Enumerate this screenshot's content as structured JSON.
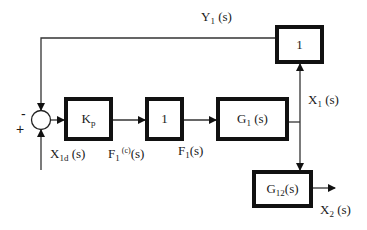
{
  "diagram": {
    "type": "block-diagram",
    "blocks": {
      "kp": {
        "main": "K",
        "sub": "p"
      },
      "unity_mid": {
        "label": "1"
      },
      "g1": {
        "main": "G",
        "sub": "1",
        "tail": " (s)"
      },
      "unity_feedback": {
        "label": "1"
      },
      "g12": {
        "main": "G",
        "sub": "12",
        "tail": "(s)"
      }
    },
    "summing_junction": {
      "minus_sign": "-",
      "plus_sign": "+"
    },
    "signals": {
      "y1": {
        "main": "Y",
        "sub": "1",
        "tail": " (s)"
      },
      "x1d": {
        "main": "X",
        "sub": "1d",
        "tail": " (s)"
      },
      "f1c": {
        "main": "F",
        "sub": "1",
        "sup": " (c)",
        "tail": "(s)"
      },
      "f1": {
        "main": "F",
        "sub": "1",
        "tail": "(s)"
      },
      "x1": {
        "main": "X",
        "sub": "1",
        "tail": " (s)"
      },
      "x2": {
        "main": "X",
        "sub": "2",
        "tail": " (s)"
      }
    },
    "colors": {
      "line": "#111111",
      "background": "#ffffff"
    }
  }
}
